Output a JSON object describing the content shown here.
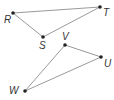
{
  "diagram": {
    "type": "geometry-triangles",
    "colors": {
      "line": "#9a9a9a",
      "point": "#222222",
      "label": "#333333"
    },
    "triangles": [
      {
        "name": "RST",
        "vertices": [
          {
            "label": "R",
            "x": 13,
            "y": 13,
            "lx": 4,
            "ly": 23
          },
          {
            "label": "S",
            "x": 43,
            "y": 37,
            "lx": 39,
            "ly": 49
          },
          {
            "label": "T",
            "x": 100,
            "y": 7,
            "lx": 103,
            "ly": 16
          }
        ]
      },
      {
        "name": "UVW",
        "vertices": [
          {
            "label": "V",
            "x": 65,
            "y": 45,
            "lx": 62,
            "ly": 40
          },
          {
            "label": "U",
            "x": 101,
            "y": 57,
            "lx": 104,
            "ly": 67
          },
          {
            "label": "W",
            "x": 25,
            "y": 91,
            "lx": 9,
            "ly": 94
          }
        ]
      }
    ]
  }
}
